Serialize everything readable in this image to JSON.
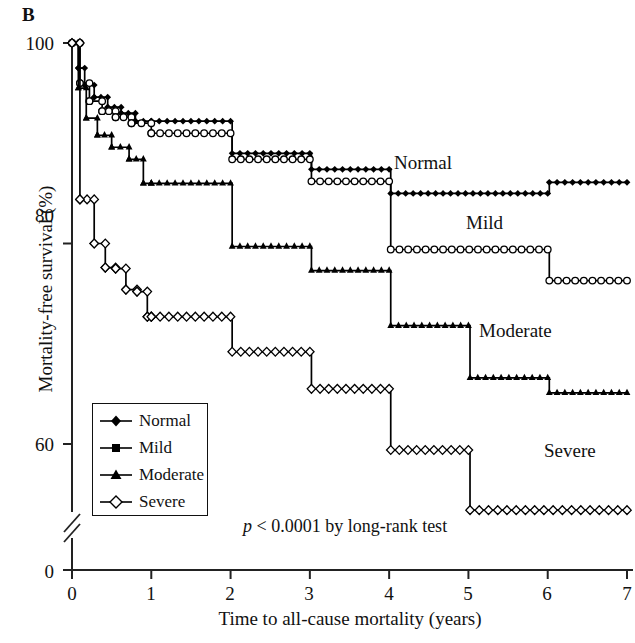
{
  "panel": {
    "label": "B"
  },
  "axes": {
    "ylabel": "Mortality-free survival (%)",
    "xlabel": "Time to all-cause mortality (years)",
    "yticks": [
      "0",
      "60",
      "80",
      "100"
    ],
    "xticks": [
      "0",
      "1",
      "2",
      "3",
      "4",
      "5",
      "6",
      "7"
    ],
    "y_break": true
  },
  "annotations": {
    "pvalue": "p < 0.0001 by long-rank test",
    "pvalue_italic": "p",
    "pvalue_rest": " < 0.0001 by long-rank test",
    "curve_labels": [
      "Normal",
      "Mild",
      "Moderate",
      "Severe"
    ]
  },
  "legend": {
    "items": [
      {
        "label": "Normal",
        "marker": "filled-diamond-icon"
      },
      {
        "label": "Mild",
        "marker": "filled-square-icon"
      },
      {
        "label": "Moderate",
        "marker": "filled-triangle-icon"
      },
      {
        "label": "Severe",
        "marker": "open-diamond-icon"
      }
    ]
  },
  "chart_data": {
    "type": "line",
    "title": "",
    "xlabel": "Time to all-cause mortality (years)",
    "ylabel": "Mortality-free survival (%)",
    "xlim": [
      0,
      7
    ],
    "ylim": [
      55,
      100
    ],
    "y_axis_break": [
      0,
      55
    ],
    "grid": false,
    "legend_position": "lower-left",
    "annotation": "p < 0.0001 by long-rank test",
    "series": [
      {
        "name": "Normal",
        "marker": "filled-diamond",
        "color": "#000000",
        "points": [
          [
            0.0,
            100.0
          ],
          [
            0.08,
            97.5
          ],
          [
            0.16,
            95.8
          ],
          [
            0.28,
            94.6
          ],
          [
            0.45,
            93.6
          ],
          [
            0.62,
            93.0
          ],
          [
            0.8,
            92.2
          ],
          [
            1.0,
            92.2
          ],
          [
            2.0,
            92.2
          ],
          [
            2.02,
            89.0
          ],
          [
            3.0,
            89.0
          ],
          [
            3.02,
            87.4
          ],
          [
            4.0,
            87.4
          ],
          [
            4.02,
            85.0
          ],
          [
            6.0,
            85.0
          ],
          [
            6.02,
            86.1
          ],
          [
            7.0,
            86.1
          ]
        ]
      },
      {
        "name": "Mild",
        "marker": "open-circle",
        "color": "#000000",
        "points": [
          [
            0.0,
            100.0
          ],
          [
            0.1,
            96.0
          ],
          [
            0.22,
            94.2
          ],
          [
            0.38,
            93.2
          ],
          [
            0.55,
            92.6
          ],
          [
            0.75,
            92.0
          ],
          [
            1.0,
            91.0
          ],
          [
            2.0,
            91.0
          ],
          [
            2.02,
            88.4
          ],
          [
            3.0,
            88.4
          ],
          [
            3.02,
            86.2
          ],
          [
            4.0,
            86.2
          ],
          [
            4.02,
            79.4
          ],
          [
            6.0,
            79.4
          ],
          [
            6.02,
            76.3
          ],
          [
            7.0,
            76.3
          ]
        ]
      },
      {
        "name": "Moderate",
        "marker": "filled-triangle",
        "color": "#000000",
        "points": [
          [
            0.0,
            100.0
          ],
          [
            0.08,
            95.5
          ],
          [
            0.18,
            92.5
          ],
          [
            0.32,
            90.8
          ],
          [
            0.5,
            89.6
          ],
          [
            0.72,
            88.4
          ],
          [
            0.9,
            86.0
          ],
          [
            1.0,
            86.0
          ],
          [
            2.0,
            86.0
          ],
          [
            2.02,
            79.7
          ],
          [
            3.0,
            79.7
          ],
          [
            3.02,
            77.3
          ],
          [
            4.0,
            77.3
          ],
          [
            4.02,
            71.8
          ],
          [
            5.0,
            71.8
          ],
          [
            5.02,
            66.6
          ],
          [
            6.0,
            66.6
          ],
          [
            6.02,
            65.1
          ],
          [
            7.0,
            65.1
          ]
        ]
      },
      {
        "name": "Severe",
        "marker": "open-diamond",
        "color": "#000000",
        "points": [
          [
            0.0,
            100.0
          ],
          [
            0.1,
            84.4
          ],
          [
            0.28,
            80.0
          ],
          [
            0.42,
            77.6
          ],
          [
            0.55,
            77.5
          ],
          [
            0.68,
            75.4
          ],
          [
            0.82,
            75.2
          ],
          [
            0.95,
            72.7
          ],
          [
            1.0,
            72.7
          ],
          [
            2.0,
            72.7
          ],
          [
            2.02,
            69.2
          ],
          [
            3.0,
            69.2
          ],
          [
            3.02,
            65.5
          ],
          [
            4.0,
            65.5
          ],
          [
            4.02,
            59.4
          ],
          [
            5.0,
            59.4
          ],
          [
            5.02,
            53.4
          ],
          [
            7.0,
            53.4
          ]
        ]
      }
    ]
  }
}
